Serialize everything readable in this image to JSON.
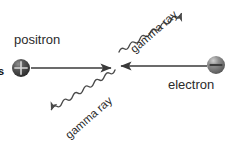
{
  "figure": {
    "width": 229,
    "height": 143,
    "background_color": "#ffffff"
  },
  "labels": {
    "positron": "positron",
    "electron": "electron",
    "gamma_upper": "gamma ray",
    "gamma_lower": "gamma ray",
    "cut_off_text": "s"
  },
  "particles": [
    {
      "name": "positron",
      "charge_symbol": "+",
      "label": "positron",
      "sphere_color": "#4a4a4a",
      "cx": 21,
      "cy": 68,
      "r": 9
    },
    {
      "name": "electron",
      "charge_symbol": "−",
      "label": "electron",
      "sphere_color": "#7d7d7d",
      "cx": 216,
      "cy": 65,
      "r": 9
    }
  ],
  "arrows": [
    {
      "name": "positron-motion-arrow",
      "direction": "right",
      "from_x": 31,
      "from_y": 68,
      "to_x": 112,
      "to_y": 68,
      "color": "#3a3a3a"
    },
    {
      "name": "electron-motion-arrow",
      "direction": "left",
      "from_x": 207,
      "from_y": 66,
      "to_x": 120,
      "to_y": 66,
      "color": "#3a3a3a"
    }
  ],
  "gamma_rays": [
    {
      "name": "gamma-ray-upper-right",
      "label": "gamma ray",
      "from_x": 119,
      "from_y": 52,
      "to_x": 176,
      "to_y": 5,
      "angle_deg": -41,
      "color": "#4a4a4a"
    },
    {
      "name": "gamma-ray-lower-left",
      "label": "gamma ray",
      "from_x": 115,
      "from_y": 70,
      "to_x": 58,
      "to_y": 120,
      "angle_deg": -41,
      "color": "#4a4a4a"
    }
  ],
  "colors": {
    "line": "#3a3a3a",
    "wave": "#4a4a4a",
    "text": "#2b2b2b",
    "positron_sphere": "#4a4a4a",
    "electron_sphere": "#7d7d7d"
  }
}
